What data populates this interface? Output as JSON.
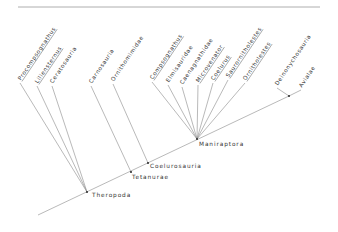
{
  "diagram": {
    "type": "cladogram",
    "top_rule": {
      "x1": 18,
      "y1": 7,
      "x2": 320,
      "y2": 7
    },
    "taxa": [
      {
        "label": "Procompsognathus",
        "underlined": true,
        "x": 20,
        "y": 82,
        "node": "Theropoda"
      },
      {
        "label": "Liliensternus",
        "underlined": true,
        "x": 37,
        "y": 85,
        "node": "Theropoda"
      },
      {
        "label": "Ceratosauria",
        "underlined": false,
        "x": 52,
        "y": 85,
        "node": "Theropoda"
      },
      {
        "label": "Carnosauria",
        "underlined": false,
        "x": 91,
        "y": 85,
        "node": "Tetanurae"
      },
      {
        "label": "Ornithomimidae",
        "underlined": false,
        "x": 113,
        "y": 83,
        "node": "Coelurosauria"
      },
      {
        "label": "Compsognathus",
        "underlined": true,
        "x": 152,
        "y": 81,
        "node": "Maniraptora"
      },
      {
        "label": "Elmisauridae",
        "underlined": false,
        "x": 168,
        "y": 84,
        "node": "Maniraptora"
      },
      {
        "label": "Caenagnathidae",
        "underlined": false,
        "x": 182,
        "y": 86,
        "node": "Maniraptora"
      },
      {
        "label": "Microvenator",
        "underlined": true,
        "x": 198,
        "y": 84,
        "node": "Maniraptora"
      },
      {
        "label": "Coelurus",
        "underlined": true,
        "x": 213,
        "y": 82,
        "node": "Maniraptora"
      },
      {
        "label": "Saurornitholestes",
        "underlined": true,
        "x": 228,
        "y": 79,
        "node": "Maniraptora"
      },
      {
        "label": "Ornitholestes",
        "underlined": true,
        "x": 245,
        "y": 82,
        "node": "Maniraptora"
      },
      {
        "label": "Deinonychosauria",
        "underlined": false,
        "x": 277,
        "y": 87,
        "node": "Deinonychosauria+Avialae"
      },
      {
        "label": "Avialae",
        "underlined": false,
        "x": 301,
        "y": 89,
        "node": "Deinonychosauria+Avialae"
      }
    ],
    "nodes": [
      {
        "name": "Theropoda",
        "label": "Theropoda",
        "x": 87,
        "y": 192,
        "label_x": 92,
        "label_y": 197
      },
      {
        "name": "Tetanurae",
        "label": "Tetanurae",
        "x": 131,
        "y": 172,
        "label_x": 132,
        "label_y": 179
      },
      {
        "name": "Coelurosauria",
        "label": "Coelurosauria",
        "x": 148,
        "y": 163,
        "label_x": 150,
        "label_y": 168
      },
      {
        "name": "Maniraptora",
        "label": "Maniraptora",
        "x": 197,
        "y": 139,
        "label_x": 199,
        "label_y": 146
      },
      {
        "name": "Deinonychosauria+Avialae",
        "label": "",
        "x": 289,
        "y": 96,
        "label_x": 0,
        "label_y": 0
      }
    ],
    "backbone": {
      "x1": 38,
      "y1": 215,
      "x2": 289,
      "y2": 96
    }
  }
}
